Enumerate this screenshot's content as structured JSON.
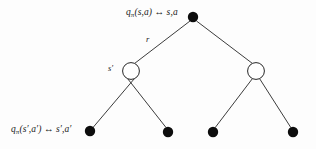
{
  "diagram": {
    "background_color": "#fdfdfd",
    "stroke_color": "#262626",
    "node_fill_black": "#0d0d0d",
    "node_fill_open": "#ffffff",
    "labels": {
      "root_state_action": "qπ(s,a) ↔ s,a",
      "root_prefix": "q",
      "root_subscript": "π",
      "root_suffix": "(s,a) ↔ s,a",
      "reward": "r",
      "next_state": "s′",
      "leaf_state_action": "qπ(s′,a′) ↔ s′,a′",
      "leaf_prefix": "q",
      "leaf_subscript": "π",
      "leaf_suffix": "(s′,a′) ↔ s′,a′"
    },
    "nodes": [
      {
        "id": "root",
        "type": "action-node",
        "x": 193,
        "y": 17,
        "r": 5.2,
        "fill": "#0d0d0d"
      },
      {
        "id": "state-left",
        "type": "state-node",
        "x": 131,
        "y": 71,
        "r": 8.4,
        "fill": "#ffffff"
      },
      {
        "id": "state-right",
        "type": "state-node",
        "x": 256,
        "y": 71,
        "r": 8.4,
        "fill": "#ffffff"
      },
      {
        "id": "leaf-1",
        "type": "action-node",
        "x": 90,
        "y": 131,
        "r": 5.2,
        "fill": "#0d0d0d"
      },
      {
        "id": "leaf-2",
        "type": "action-node",
        "x": 168,
        "y": 132,
        "r": 5.2,
        "fill": "#0d0d0d"
      },
      {
        "id": "leaf-3",
        "type": "action-node",
        "x": 213,
        "y": 132,
        "r": 5.2,
        "fill": "#0d0d0d"
      },
      {
        "id": "leaf-4",
        "type": "action-node",
        "x": 293,
        "y": 132,
        "r": 5.2,
        "fill": "#0d0d0d"
      }
    ],
    "edges": [
      {
        "from": "root",
        "to": "state-left"
      },
      {
        "from": "root",
        "to": "state-right"
      },
      {
        "from": "state-left",
        "to": "leaf-1"
      },
      {
        "from": "state-left",
        "to": "leaf-2"
      },
      {
        "from": "state-right",
        "to": "leaf-3"
      },
      {
        "from": "state-right",
        "to": "leaf-4"
      }
    ]
  }
}
